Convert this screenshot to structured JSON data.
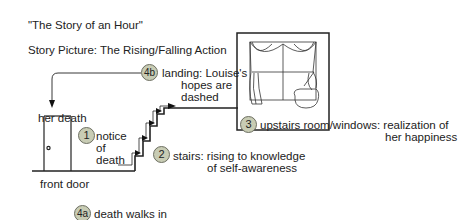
{
  "title": "\"The Story of an Hour\"",
  "subtitle": "Story Picture: The Rising/Falling Action",
  "labels": {
    "front_door": "front door",
    "her_death": "her death"
  },
  "steps": [
    {
      "id": "1",
      "lines": [
        "notice",
        "of",
        "death"
      ]
    },
    {
      "id": "2",
      "lines": [
        "stairs: rising to knowledge",
        "of self-awareness"
      ]
    },
    {
      "id": "3",
      "lines": [
        "upstairs room/windows: realization of",
        "her happiness"
      ]
    },
    {
      "id": "4a",
      "lines": [
        "death walks in"
      ]
    },
    {
      "id": "4b",
      "lines": [
        "landing: Louise's",
        "hopes are",
        "dashed"
      ]
    }
  ],
  "colors": {
    "badge_fill": "#c8ccb4",
    "badge_border": "#6d6f62",
    "line": "#222222"
  }
}
